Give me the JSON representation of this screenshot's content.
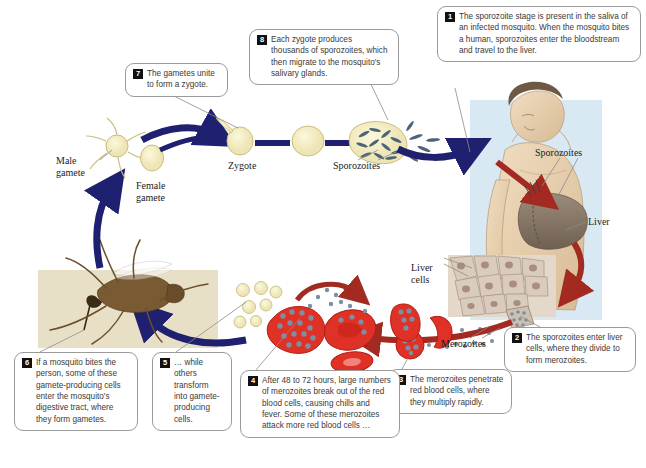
{
  "diagram": {
    "colors": {
      "arrow_blue": "#1f2070",
      "arrow_red": "#a32a20",
      "cell_cream": "#f2edc4",
      "sporozoite": "#4d6378",
      "rbc_red": "#e03127",
      "merozoite": "#7d8fa3",
      "human_panel": "#d8e9f4",
      "skin_panel": "#e8e0c6",
      "liver_cell": "#d9cbbd",
      "badge": "#111111",
      "callout_border": "#9a9a9a"
    }
  },
  "callouts": [
    {
      "number": "1",
      "text": "The sporozoite stage is present in the saliva of an infected mosquito. When the mosquito bites a human, sporozoites enter the bloodstream and travel to the liver."
    },
    {
      "number": "2",
      "text": "The sporozoites enter liver cells, where they divide to form merozoites."
    },
    {
      "number": "3",
      "text": "The merozoites penetrate red blood cells, where they multiply rapidly."
    },
    {
      "number": "4",
      "text": "After 48 to 72 hours, large numbers of merozoites break out of the red blood cells, causing chills and fever. Some of these merozoites attack more red blood cells …"
    },
    {
      "number": "5",
      "text": "… while others transform into gamete-producing cells."
    },
    {
      "number": "6",
      "text": "If a mosquito bites the person, some of these gamete-producing cells enter the mosquito's digestive tract, where they form gametes."
    },
    {
      "number": "7",
      "text": "The gametes unite to form a zygote."
    },
    {
      "number": "8",
      "text": "Each zygote produces thousands of sporozoites, which then migrate to the mosquito's salivary glands."
    }
  ],
  "labels": {
    "male_gamete": "Male\ngamete",
    "female_gamete": "Female\ngamete",
    "zygote": "Zygote",
    "sporozoites_mosquito": "Sporozoites",
    "sporozoites_human": "Sporozoites",
    "liver": "Liver",
    "liver_cells": "Liver\ncells",
    "merozoites": "Merozoites"
  }
}
